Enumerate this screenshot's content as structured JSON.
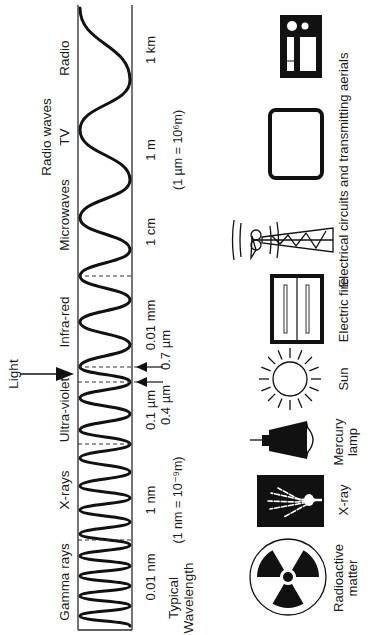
{
  "diagram": {
    "orientation": "rotated 90° counter-clockwise",
    "light_label": "Light",
    "bands": [
      {
        "name": "Radio",
        "group": "Radio waves"
      },
      {
        "name": "TV",
        "group": "Radio waves"
      },
      {
        "name": "Microwaves"
      },
      {
        "name": "Infra-red"
      },
      {
        "name": "Ultra-violet"
      },
      {
        "name": "X-rays"
      },
      {
        "name": "Gamma rays"
      }
    ],
    "group_label": "Radio waves",
    "wavelengths": {
      "radio": "1 km",
      "tv": "1 m",
      "microwaves": "1 cm",
      "infrared": "0.01 mm",
      "visible_red": "0.7 µm",
      "visible_violet": "0.4 µm",
      "ultraviolet": "0.1 µm",
      "xrays": "1 nm",
      "gamma": "0.01 nm"
    },
    "notes": {
      "micrometre": "(1 µm = 10⁶m)",
      "nanometre": "(1 nm = 10⁻⁹m)",
      "typical_line1": "Typical",
      "typical_line2": "Wavelength"
    },
    "sources": [
      {
        "icon": "radio-set-icon",
        "label": "Electrical circuits and transmitting aerials"
      },
      {
        "icon": "television-icon",
        "label": ""
      },
      {
        "icon": "transmitting-aerial-icon",
        "label": ""
      },
      {
        "icon": "electric-fire-icon",
        "label": "Electric fire"
      },
      {
        "icon": "sun-icon",
        "label": "Sun"
      },
      {
        "icon": "mercury-lamp-icon",
        "label_line1": "Mercury",
        "label_line2": "lamp"
      },
      {
        "icon": "xray-hand-icon",
        "label": "X-ray"
      },
      {
        "icon": "radiation-trefoil-icon",
        "label_line1": "Radioactive",
        "label_line2": "matter"
      }
    ],
    "labels": {
      "radio": "Radio",
      "tv": "TV",
      "radio_waves": "Radio waves",
      "microwaves": "Microwaves",
      "infrared": "Infra-red",
      "ultraviolet": "Ultra-violet",
      "xrays": "X-rays",
      "gamma": "Gamma rays",
      "electrical": "Electrical circuits and transmitting aerials",
      "electric_fire": "Electric fire",
      "sun": "Sun",
      "mercury_1": "Mercury",
      "mercury_2": "lamp",
      "xray": "X-ray",
      "radioactive_1": "Radioactive",
      "radioactive_2": "matter"
    }
  }
}
